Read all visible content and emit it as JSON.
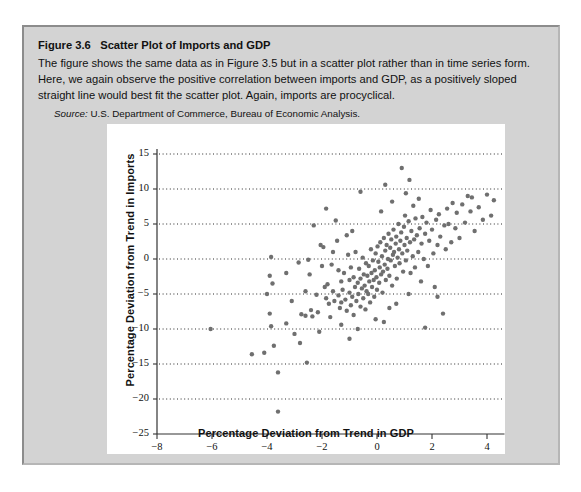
{
  "figure": {
    "number": "Figure 3.6",
    "title": "Scatter Plot of Imports and GDP",
    "body": "The figure shows the same data as in Figure 3.5 but in a scatter plot rather than in time series form. Here, we again observe the positive correlation between imports and GDP, as a positively sloped straight line would best fit the scatter plot. Again, imports are procyclical.",
    "source_label": "Source:",
    "source_text": "U.S. Department of Commerce, Bureau of Economic Analysis."
  },
  "chart_data": {
    "type": "scatter",
    "title": "",
    "xlabel": "Percentage Deviation from Trend in GDP",
    "ylabel": "Percentage Deviation from Trend in Imports",
    "xlim": [
      -8,
      5
    ],
    "ylim": [
      -25,
      16
    ],
    "xticks": [
      -8,
      -6,
      -4,
      -2,
      0,
      2,
      4
    ],
    "yticks": [
      -25,
      -20,
      -15,
      -10,
      -5,
      0,
      5,
      10,
      15
    ],
    "xtick_labels": [
      "−8",
      "−6",
      "−4",
      "−2",
      "0",
      "2",
      "4"
    ],
    "ytick_labels": [
      "−25",
      "−20",
      "−15",
      "−10",
      "−5",
      "0",
      "5",
      "10",
      "15"
    ],
    "grid": "horizontal-dotted",
    "gridlines_y": [
      -20,
      -15,
      -10,
      -5,
      0,
      5,
      10,
      15
    ],
    "legend": "none",
    "marker_color": "#6f6f6f",
    "marker_size": 4.4,
    "points": [
      [
        -6.05,
        -10.0
      ],
      [
        -4.55,
        -13.6
      ],
      [
        -4.1,
        -13.4
      ],
      [
        -3.85,
        0.3
      ],
      [
        -3.9,
        -2.4
      ],
      [
        -3.8,
        -3.5
      ],
      [
        -3.9,
        -7.8
      ],
      [
        -3.85,
        -9.6
      ],
      [
        -3.75,
        -12.4
      ],
      [
        -3.6,
        -16.2
      ],
      [
        -3.6,
        -21.8
      ],
      [
        -3.3,
        -2.0
      ],
      [
        -3.3,
        -9.2
      ],
      [
        -3.0,
        -10.7
      ],
      [
        -2.85,
        -0.5
      ],
      [
        -2.75,
        -7.9
      ],
      [
        -2.6,
        -8.1
      ],
      [
        -2.55,
        -14.8
      ],
      [
        -2.5,
        -0.1
      ],
      [
        -2.45,
        -2.2
      ],
      [
        -2.4,
        -7.3
      ],
      [
        -2.35,
        -8.2
      ],
      [
        -2.2,
        -5.1
      ],
      [
        -2.15,
        -7.6
      ],
      [
        -2.1,
        -10.4
      ],
      [
        -2.05,
        2.0
      ],
      [
        -1.95,
        1.7
      ],
      [
        -1.9,
        -4.0
      ],
      [
        -1.85,
        -5.6
      ],
      [
        -1.8,
        -3.6
      ],
      [
        -1.75,
        -6.4
      ],
      [
        -1.7,
        -8.3
      ],
      [
        -1.65,
        -0.8
      ],
      [
        -1.6,
        -4.6
      ],
      [
        -1.55,
        -6.0
      ],
      [
        -1.5,
        5.5
      ],
      [
        -1.45,
        2.6
      ],
      [
        -1.4,
        -1.6
      ],
      [
        -1.4,
        -5.2
      ],
      [
        -1.35,
        -7.0
      ],
      [
        -1.3,
        -3.2
      ],
      [
        -1.3,
        -6.2
      ],
      [
        -1.25,
        -4.4
      ],
      [
        -1.2,
        -2.0
      ],
      [
        -1.15,
        -5.8
      ],
      [
        -1.1,
        -7.4
      ],
      [
        -1.05,
        0.6
      ],
      [
        -1.0,
        -3.0
      ],
      [
        -1.0,
        -4.8
      ],
      [
        -0.95,
        -6.6
      ],
      [
        -0.95,
        -1.2
      ],
      [
        -0.9,
        -5.4
      ],
      [
        -0.85,
        -2.6
      ],
      [
        -0.85,
        -8.0
      ],
      [
        -0.8,
        -4.0
      ],
      [
        -0.78,
        1.0
      ],
      [
        -0.75,
        -6.0
      ],
      [
        -0.7,
        -3.4
      ],
      [
        -0.68,
        -5.0
      ],
      [
        -0.65,
        -1.4
      ],
      [
        -0.6,
        -2.8
      ],
      [
        -0.6,
        -6.8
      ],
      [
        -0.55,
        -4.2
      ],
      [
        -0.52,
        0.2
      ],
      [
        -0.5,
        -5.6
      ],
      [
        -0.48,
        -2.2
      ],
      [
        -0.45,
        -3.8
      ],
      [
        -0.42,
        -7.2
      ],
      [
        -0.4,
        -0.6
      ],
      [
        -0.38,
        -4.6
      ],
      [
        -0.35,
        -2.4
      ],
      [
        -0.32,
        -5.0
      ],
      [
        -0.3,
        -1.0
      ],
      [
        -0.28,
        -3.2
      ],
      [
        -0.25,
        -6.2
      ],
      [
        -0.22,
        1.4
      ],
      [
        -0.2,
        -2.0
      ],
      [
        -0.18,
        -4.0
      ],
      [
        -0.15,
        -0.2
      ],
      [
        -0.12,
        -3.0
      ],
      [
        -0.1,
        -5.4
      ],
      [
        -0.08,
        -1.6
      ],
      [
        -0.05,
        0.8
      ],
      [
        -0.02,
        -2.6
      ],
      [
        0.0,
        -4.4
      ],
      [
        0.02,
        1.8
      ],
      [
        0.05,
        -0.4
      ],
      [
        0.08,
        -3.4
      ],
      [
        0.1,
        -1.2
      ],
      [
        0.12,
        2.4
      ],
      [
        0.15,
        -2.2
      ],
      [
        0.18,
        0.4
      ],
      [
        0.2,
        -4.8
      ],
      [
        0.22,
        -1.8
      ],
      [
        0.25,
        3.0
      ],
      [
        0.28,
        -0.8
      ],
      [
        0.3,
        1.2
      ],
      [
        0.32,
        -3.0
      ],
      [
        0.35,
        2.0
      ],
      [
        0.38,
        -1.4
      ],
      [
        0.4,
        0.0
      ],
      [
        0.42,
        3.6
      ],
      [
        0.45,
        -2.4
      ],
      [
        0.48,
        1.6
      ],
      [
        0.5,
        -0.2
      ],
      [
        0.52,
        2.8
      ],
      [
        0.55,
        -3.8
      ],
      [
        0.58,
        0.6
      ],
      [
        0.6,
        4.2
      ],
      [
        0.62,
        1.0
      ],
      [
        0.65,
        -1.0
      ],
      [
        0.68,
        2.2
      ],
      [
        0.7,
        3.2
      ],
      [
        0.72,
        -2.8
      ],
      [
        0.75,
        0.2
      ],
      [
        0.78,
        5.0
      ],
      [
        0.8,
        1.4
      ],
      [
        0.82,
        -0.6
      ],
      [
        0.85,
        2.6
      ],
      [
        0.88,
        3.8
      ],
      [
        0.9,
        13.0
      ],
      [
        0.92,
        0.8
      ],
      [
        0.95,
        -1.8
      ],
      [
        0.98,
        4.6
      ],
      [
        1.0,
        2.0
      ],
      [
        1.02,
        6.2
      ],
      [
        1.05,
        -0.2
      ],
      [
        1.08,
        3.0
      ],
      [
        1.1,
        1.2
      ],
      [
        1.15,
        5.4
      ],
      [
        1.18,
        11.3
      ],
      [
        1.2,
        2.4
      ],
      [
        1.22,
        -2.0
      ],
      [
        1.25,
        4.0
      ],
      [
        1.3,
        0.4
      ],
      [
        1.32,
        7.6
      ],
      [
        1.35,
        2.8
      ],
      [
        1.38,
        -1.2
      ],
      [
        1.4,
        5.8
      ],
      [
        1.45,
        3.4
      ],
      [
        1.5,
        1.0
      ],
      [
        1.52,
        8.6
      ],
      [
        1.55,
        4.4
      ],
      [
        1.6,
        -3.2
      ],
      [
        1.62,
        2.2
      ],
      [
        1.65,
        6.0
      ],
      [
        1.7,
        0.0
      ],
      [
        1.75,
        3.6
      ],
      [
        1.8,
        5.2
      ],
      [
        1.85,
        -1.0
      ],
      [
        1.9,
        2.6
      ],
      [
        1.95,
        7.0
      ],
      [
        2.0,
        4.2
      ],
      [
        2.05,
        0.8
      ],
      [
        2.1,
        -4.0
      ],
      [
        2.15,
        5.6
      ],
      [
        2.2,
        2.0
      ],
      [
        2.25,
        6.4
      ],
      [
        2.3,
        3.2
      ],
      [
        2.4,
        -7.8
      ],
      [
        2.45,
        4.8
      ],
      [
        2.5,
        1.4
      ],
      [
        2.55,
        7.2
      ],
      [
        2.6,
        5.0
      ],
      [
        2.7,
        2.4
      ],
      [
        2.75,
        8.0
      ],
      [
        2.85,
        4.4
      ],
      [
        2.9,
        6.6
      ],
      [
        3.0,
        3.0
      ],
      [
        3.1,
        7.8
      ],
      [
        3.2,
        5.2
      ],
      [
        3.3,
        9.0
      ],
      [
        3.4,
        6.8
      ],
      [
        3.45,
        8.8
      ],
      [
        3.55,
        4.0
      ],
      [
        3.7,
        7.4
      ],
      [
        3.85,
        5.6
      ],
      [
        4.0,
        9.2
      ],
      [
        4.15,
        6.2
      ],
      [
        4.25,
        8.4
      ],
      [
        -2.3,
        4.8
      ],
      [
        -1.85,
        7.2
      ],
      [
        -0.6,
        9.6
      ],
      [
        0.3,
        10.6
      ],
      [
        0.55,
        8.2
      ],
      [
        -1.1,
        3.4
      ],
      [
        -2.0,
        -1.0
      ],
      [
        -2.6,
        -4.6
      ],
      [
        -3.1,
        -6.0
      ],
      [
        -1.6,
        1.0
      ],
      [
        -0.9,
        4.0
      ],
      [
        0.15,
        6.8
      ],
      [
        1.05,
        9.4
      ],
      [
        -4.0,
        -5.0
      ],
      [
        2.2,
        -5.4
      ],
      [
        1.15,
        -5.0
      ],
      [
        0.7,
        -6.4
      ],
      [
        -0.05,
        -8.6
      ],
      [
        0.45,
        -7.0
      ],
      [
        -1.3,
        -9.4
      ],
      [
        -0.7,
        -10.0
      ],
      [
        0.25,
        -9.0
      ],
      [
        1.75,
        -9.8
      ],
      [
        -2.8,
        -12.0
      ],
      [
        -1.0,
        -11.4
      ]
    ]
  }
}
